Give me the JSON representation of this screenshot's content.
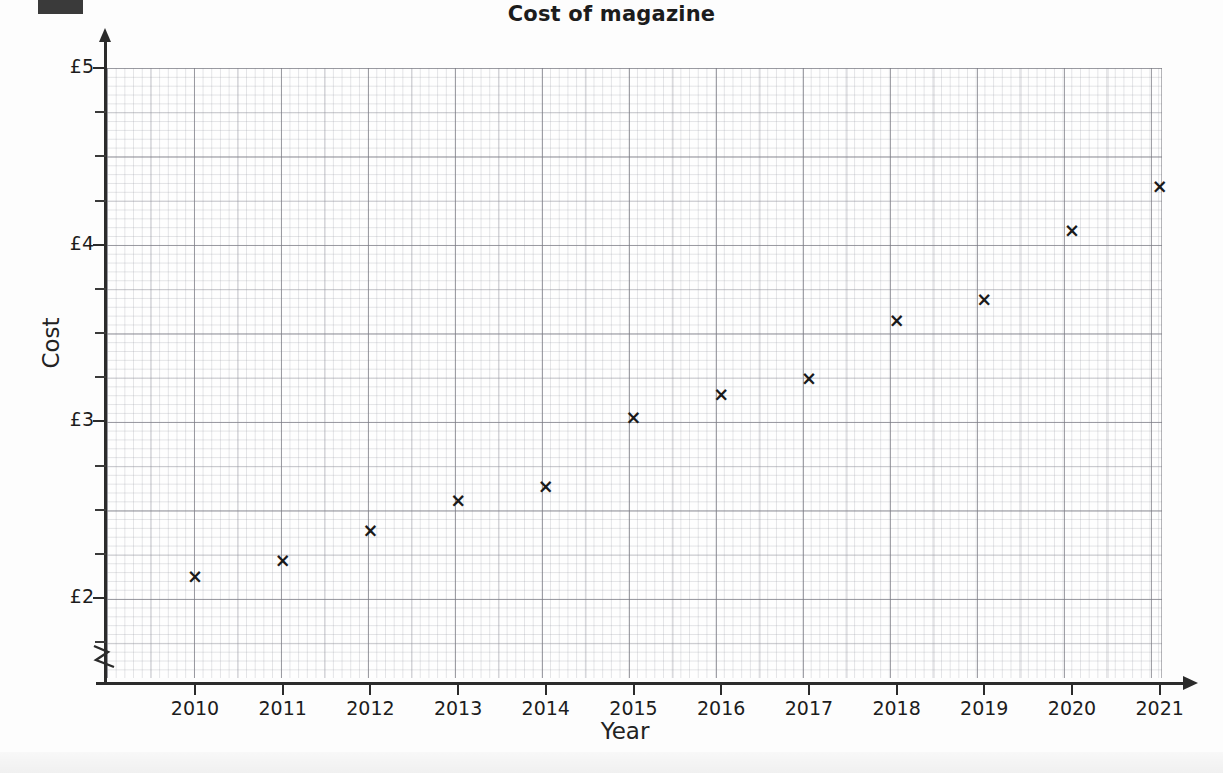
{
  "page": {
    "title": "Cost of magazine",
    "redaction_block": "redacted-label"
  },
  "chart_data": {
    "type": "scatter",
    "title": "Cost of magazine",
    "xlabel": "Year",
    "ylabel": "Cost",
    "x": [
      2010,
      2011,
      2012,
      2013,
      2014,
      2015,
      2016,
      2017,
      2018,
      2019,
      2020,
      2021
    ],
    "values": [
      2.12,
      2.21,
      2.38,
      2.55,
      2.63,
      3.02,
      3.15,
      3.24,
      3.57,
      3.69,
      4.08,
      4.33
    ],
    "xlim": [
      2009.3,
      2021.3
    ],
    "ylim": [
      1.75,
      5.0
    ],
    "ytick_labels": [
      "£5",
      "£4",
      "£3",
      "£2"
    ],
    "ytick_values": [
      5,
      4,
      3,
      2
    ],
    "yminor_step": 0.25,
    "xtick_labels": [
      "2010",
      "2011",
      "2012",
      "2013",
      "2014",
      "2015",
      "2016",
      "2017",
      "2018",
      "2019",
      "2020",
      "2021"
    ],
    "grid": true,
    "grid_style": "graph-paper",
    "axis_break": true,
    "legend": "none",
    "marker": "×",
    "marker_color": "#1a1a1a"
  },
  "axes": {
    "y_title": "Cost",
    "x_title": "Year",
    "y_ticks": [
      {
        "label": "£5",
        "value": 5
      },
      {
        "label": "£4",
        "value": 4
      },
      {
        "label": "£3",
        "value": 3
      },
      {
        "label": "£2",
        "value": 2
      }
    ],
    "x_ticks": [
      {
        "label": "2010",
        "value": 2010
      },
      {
        "label": "2011",
        "value": 2011
      },
      {
        "label": "2012",
        "value": 2012
      },
      {
        "label": "2013",
        "value": 2013
      },
      {
        "label": "2014",
        "value": 2014
      },
      {
        "label": "2015",
        "value": 2015
      },
      {
        "label": "2016",
        "value": 2016
      },
      {
        "label": "2017",
        "value": 2017
      },
      {
        "label": "2018",
        "value": 2018
      },
      {
        "label": "2019",
        "value": 2019
      },
      {
        "label": "2020",
        "value": 2020
      },
      {
        "label": "2021",
        "value": 2021
      }
    ]
  },
  "colors": {
    "ink": "#1c1c1c",
    "axis": "#2b2b2b",
    "grid_major": "#787880",
    "grid_minor": "#969aa2",
    "paper": "#fdfdfd",
    "redaction": "#3a3a3a"
  }
}
